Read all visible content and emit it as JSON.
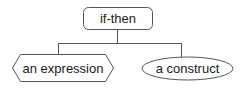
{
  "diagram": {
    "type": "tree",
    "root": {
      "label": "if-then",
      "shape": "rounded-rectangle"
    },
    "children": [
      {
        "label": "an expression",
        "shape": "hexagon"
      },
      {
        "label": "a construct",
        "shape": "ellipse"
      }
    ],
    "colors": {
      "stroke": "#555555",
      "fill": "#ffffff",
      "text": "#1a1a1a",
      "background": "#ffffff"
    }
  }
}
